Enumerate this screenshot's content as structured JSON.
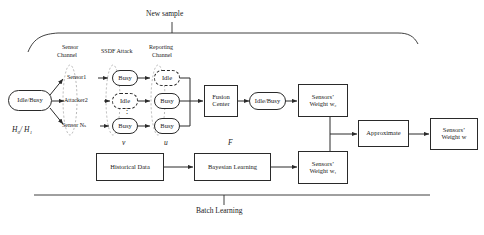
{
  "diagram": {
    "title_top": "New sample",
    "title_bottom": "Batch Learning",
    "column_headers": {
      "sensor_channel": "Sensor\nChannel",
      "sensor_channel_l1": "Sensor",
      "sensor_channel_l2": "Channel",
      "ssdf_attack": "SSDF Attack",
      "reporting_channel_l1": "Reporting",
      "reporting_channel_l2": "Channel"
    },
    "signal_labels": {
      "source_hypothesis": "H₀/ H₁",
      "v": "v",
      "u": "u",
      "F": "F"
    },
    "nodes": {
      "source": "Idle/Busy",
      "sensor1": "Sensor1",
      "attacker2": "Attacker2",
      "sensorN": "Sensor Nₛ",
      "ssdf_row1": "Busy",
      "ssdf_row2": "Idle",
      "ssdf_row3": "Busy",
      "report_row1": "Idle",
      "report_row2": "Busy",
      "report_row3": "Busy",
      "fusion_center_l1": "Fusion",
      "fusion_center_l2": "Center",
      "fusion_output": "Idle/Busy",
      "weight_w2_l1": "Sensors’",
      "weight_w2_l2": "Weight w₂",
      "historical_data": "Historical Data",
      "bayesian_learning": "Bayesian Learning",
      "weight_w1_l1": "Sensors’",
      "weight_w1_l2": "Weight w₁",
      "approximate": "Approximate",
      "weight_w_l1": "Sensors’",
      "weight_w_l2": "Weight w"
    },
    "ellipsis": "⋮",
    "colors": {
      "stroke": "#2a2a2a",
      "background": "#ffffff",
      "text": "#1a1a1a"
    }
  }
}
